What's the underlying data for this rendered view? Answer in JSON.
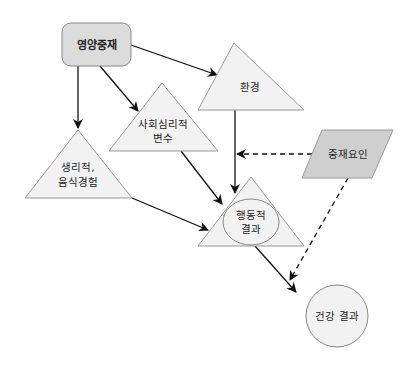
{
  "diagram": {
    "nodes": {
      "intervention": {
        "label": "영양중재",
        "shape": "rounded-rect",
        "fill": "#dcdcdc"
      },
      "environment": {
        "label": "환경",
        "shape": "triangle",
        "fill": "#f2f2f2"
      },
      "psychosocial": {
        "line1": "사회심리적",
        "line2": "변수",
        "shape": "triangle",
        "fill": "#f2f2f2"
      },
      "physiological": {
        "line1": "생리적,",
        "line2": "음식경험",
        "shape": "triangle",
        "fill": "#f2f2f2"
      },
      "behavioral": {
        "line1": "행동적",
        "line2": "결과",
        "shape": "triangle-with-ellipse",
        "fill": "#f2f2f2"
      },
      "mediator": {
        "label": "중재요인",
        "shape": "parallelogram",
        "fill": "#cfcfcf"
      },
      "health": {
        "label": "건강 결과",
        "shape": "circle",
        "fill": "#f2f2f2"
      }
    },
    "edges": [
      {
        "from": "영양중재",
        "to": "환경",
        "style": "solid"
      },
      {
        "from": "영양중재",
        "to": "사회심리적 변수",
        "style": "solid"
      },
      {
        "from": "영양중재",
        "to": "생리적, 음식경험",
        "style": "solid"
      },
      {
        "from": "환경",
        "to": "행동적 결과",
        "style": "solid"
      },
      {
        "from": "사회심리적 변수",
        "to": "행동적 결과",
        "style": "solid"
      },
      {
        "from": "생리적, 음식경험",
        "to": "행동적 결과",
        "style": "solid"
      },
      {
        "from": "행동적 결과",
        "to": "건강 결과",
        "style": "solid"
      },
      {
        "from": "중재요인",
        "to": "환경→행동적 결과 경로",
        "style": "dashed"
      },
      {
        "from": "중재요인",
        "to": "건강 결과",
        "style": "dashed"
      }
    ],
    "colors": {
      "stroke": "#888888",
      "arrow": "#111111"
    }
  }
}
